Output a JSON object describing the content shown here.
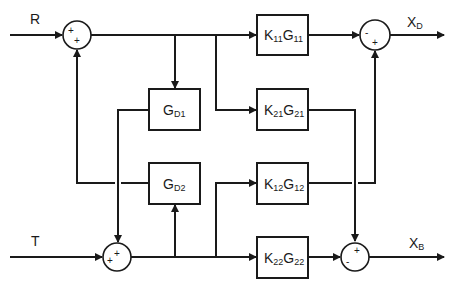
{
  "diagram": {
    "type": "block-diagram",
    "inputs": [
      {
        "id": "R",
        "label": "R"
      },
      {
        "id": "T",
        "label": "T"
      }
    ],
    "outputs": [
      {
        "id": "XD",
        "label": "X",
        "sub": "D"
      },
      {
        "id": "XB",
        "label": "X",
        "sub": "B"
      }
    ],
    "blocks": {
      "gd1": {
        "main": "G",
        "sub": "D1"
      },
      "gd2": {
        "main": "G",
        "sub": "D2"
      },
      "k11g11": {
        "k": "K",
        "ksub": "11",
        "g": "G",
        "gsub": "11"
      },
      "k21g21": {
        "k": "K",
        "ksub": "21",
        "g": "G",
        "gsub": "21"
      },
      "k12g12": {
        "k": "K",
        "ksub": "12",
        "g": "G",
        "gsub": "12"
      },
      "k22g22": {
        "k": "K",
        "ksub": "22",
        "g": "G",
        "gsub": "22"
      }
    },
    "summing_junctions": {
      "s1": {
        "signs": [
          "+",
          "+"
        ]
      },
      "s2": {
        "signs": [
          "+",
          "+"
        ]
      },
      "s3": {
        "signs": [
          "-",
          "+"
        ]
      },
      "s4": {
        "signs": [
          "+",
          "-"
        ]
      }
    },
    "colors": {
      "stroke": "#1a1a1a",
      "background": "#ffffff"
    }
  }
}
